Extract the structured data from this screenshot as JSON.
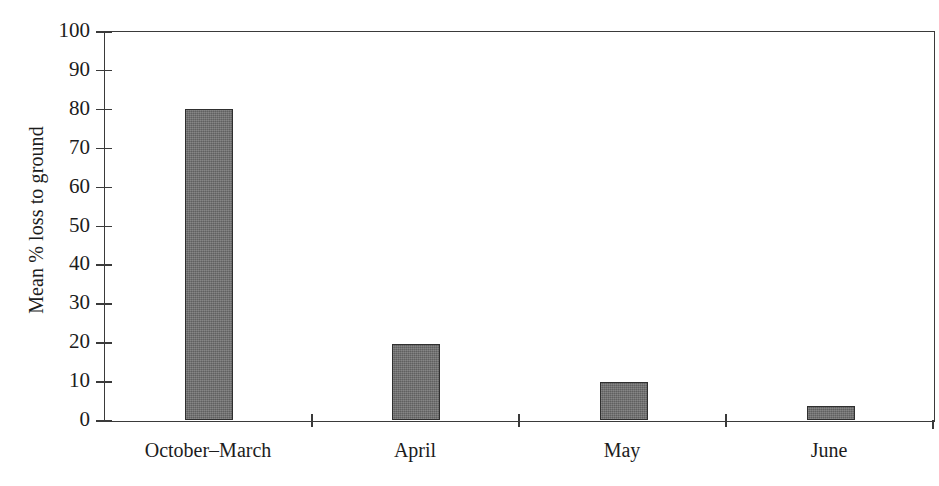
{
  "chart_data": {
    "type": "bar",
    "title": "",
    "subtitle": "",
    "xlabel": "",
    "ylabel": "Mean % loss to ground",
    "categories": [
      "October–March",
      "April",
      "May",
      "June"
    ],
    "values": [
      80,
      19.5,
      9.7,
      3.5
    ],
    "series": [
      {
        "name": "Mean % loss to ground",
        "values": [
          80,
          19.5,
          9.7,
          3.5
        ]
      }
    ],
    "ylim": [
      0,
      100
    ],
    "ytick_labels": [
      "100",
      "90",
      "80",
      "70",
      "60",
      "50",
      "40",
      "30",
      "20",
      "10",
      "0"
    ],
    "ytick_values": [
      100,
      90,
      80,
      70,
      60,
      50,
      40,
      30,
      20,
      10,
      0
    ],
    "ytick_step": 10,
    "grid": false,
    "legend": false,
    "legend_position": "none",
    "annotations": [],
    "bar_color": "#6b6b6b",
    "bar_edge_color": "#2f2f2f",
    "axis_color": "#3a3a3a",
    "background_color": "#ffffff",
    "frame": "full-box"
  },
  "figure": {
    "y_axis_title": "Mean % loss to ground"
  }
}
